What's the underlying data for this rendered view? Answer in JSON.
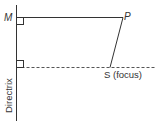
{
  "diagram": {
    "title": "",
    "points": {
      "M": {
        "label": "M"
      },
      "P": {
        "label": "P"
      },
      "S": {
        "label": "S (focus)"
      }
    },
    "directrix_label": "Directrix",
    "colors": {
      "line": "#333333",
      "dashed": "#555555",
      "background": "#ffffff"
    }
  }
}
